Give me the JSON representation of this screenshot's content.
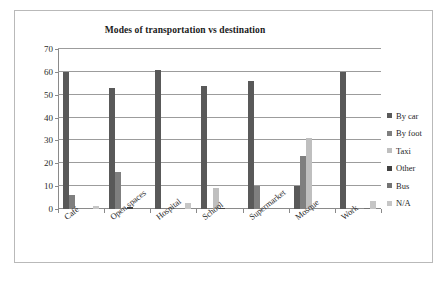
{
  "chart_data": {
    "type": "bar",
    "title": "Modes of transportation vs destination",
    "xlabel": "",
    "ylabel": "",
    "ylim": [
      0,
      70
    ],
    "yticks": [
      0,
      10,
      20,
      30,
      40,
      50,
      60,
      70
    ],
    "grid": true,
    "legend_position": "right",
    "categories": [
      "Café",
      "Open spaces",
      "Hospital",
      "School",
      "Supermarket",
      "Mosque",
      "Work"
    ],
    "series": [
      {
        "name": "By car",
        "color": "#595959",
        "values": [
          60,
          53,
          61,
          54,
          56,
          10,
          60
        ]
      },
      {
        "name": "By foot",
        "color": "#7f7f7f",
        "values": [
          6,
          16,
          0.5,
          0.5,
          10,
          23,
          0
        ]
      },
      {
        "name": "Taxi",
        "color": "#bfbfbf",
        "values": [
          0,
          0,
          0,
          9,
          0,
          31,
          0
        ]
      },
      {
        "name": "Other",
        "color": "#404040",
        "values": [
          0,
          0.7,
          0,
          0.5,
          0,
          0,
          0
        ]
      },
      {
        "name": "Bus",
        "color": "#737373",
        "values": [
          0,
          0,
          0,
          0,
          0,
          0,
          0.5
        ]
      },
      {
        "name": "N/A",
        "color": "#c6c6c6",
        "values": [
          1.5,
          0,
          2.5,
          0,
          0,
          0,
          3.5
        ]
      }
    ]
  },
  "colors": {
    "frame_border": "#b9b9b9",
    "axis": "#8a8a8a",
    "gridline": "#9c9c9c",
    "background": "#ffffff",
    "text": "#262626"
  }
}
